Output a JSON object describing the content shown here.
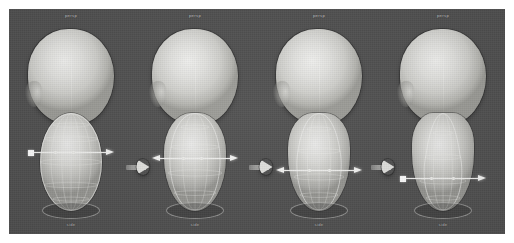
{
  "figure": {
    "background_color": "#4c4c4c",
    "page_background": "#ffffff",
    "accent_color": "#e2e2df",
    "caption_color": "#c9c9c9"
  },
  "panels": [
    {
      "id": "panel-1",
      "top_label": "persp",
      "bottom_label": "side",
      "shape_class": "shape-ellipsoid",
      "gizmo": {
        "top_px": 26,
        "style": "square-handle-right-arrow"
      }
    },
    {
      "id": "panel-2",
      "top_label": "persp",
      "bottom_label": "side",
      "shape_class": "shape-pear-1",
      "gizmo": {
        "top_px": 32,
        "style": "double-arrow"
      }
    },
    {
      "id": "panel-3",
      "top_label": "persp",
      "bottom_label": "side",
      "shape_class": "shape-pear-2",
      "gizmo": {
        "top_px": 44,
        "style": "double-arrow"
      }
    },
    {
      "id": "panel-4",
      "top_label": "persp",
      "bottom_label": "side",
      "shape_class": "shape-pear-3",
      "gizmo": {
        "top_px": 52,
        "style": "square-handle-right-arrow"
      }
    }
  ],
  "step_arrows": [
    {
      "id": "step-arrow-1",
      "icon": "arrow-right-icon"
    },
    {
      "id": "step-arrow-2",
      "icon": "arrow-right-icon"
    },
    {
      "id": "step-arrow-3",
      "icon": "arrow-right-icon"
    }
  ]
}
